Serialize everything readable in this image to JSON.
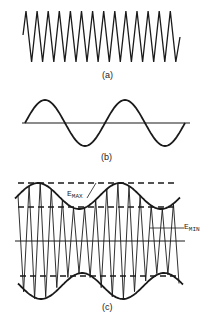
{
  "panels": {
    "a": {
      "label": "(a)",
      "description": "carrier triangle wave",
      "start": [
        23,
        35
      ],
      "peaks_y": 11,
      "troughs_y": 62,
      "first_peak_x": 26,
      "period": 11.1,
      "count": 14,
      "end": [
        180,
        37
      ]
    },
    "b": {
      "label": "(b)",
      "description": "modulating sine wave",
      "axis_y": 123,
      "axis_x": [
        22,
        190
      ],
      "x_start": 25,
      "x_end": 185,
      "amplitude": 23,
      "cycles": 2
    },
    "c": {
      "label": "(c)",
      "description": "amplitude-modulated wave",
      "axis_y": 241,
      "axis_x": [
        15,
        185
      ],
      "dashed_lines": [
        {
          "y": 183,
          "x": [
            18,
            177
          ]
        },
        {
          "y": 207,
          "x": [
            18,
            177
          ]
        },
        {
          "y": 276,
          "x": [
            20,
            180
          ]
        }
      ],
      "envelope": {
        "x_start": 15,
        "x_end": 180,
        "mean": 45,
        "depth": 13,
        "phase_x": 38,
        "period": 82
      },
      "e_max_label": {
        "main": "E",
        "sub": "MAX"
      },
      "e_min_label": {
        "main": "E",
        "sub": "MIN"
      }
    }
  },
  "colors": {
    "ink": "#1a1a1a",
    "background": "#ffffff"
  }
}
